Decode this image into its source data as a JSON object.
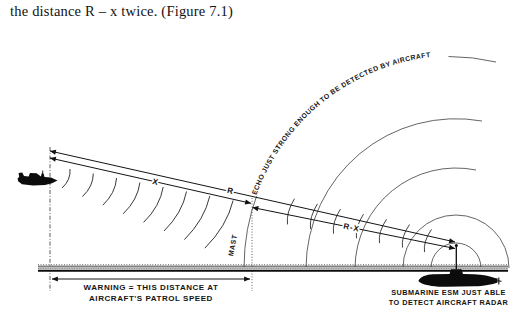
{
  "caption": "the distance R – x twice. (Figure 7.1)",
  "figure": {
    "distance_labels": {
      "x": "X",
      "r": "R",
      "r_minus_x": "R-X"
    },
    "mast_label": "MAST",
    "echo_label": "ECHO JUST STRONG ENOUGH TO BE DETECTED BY AIRCRAFT",
    "warning": {
      "line1": "WARNING = THIS DISTANCE AT",
      "line2": "AIRCRAFT'S PATROL SPEED"
    },
    "submarine_caption": {
      "line1": "SUBMARINE ESM JUST ABLE",
      "line2": "TO DETECT AIRCRAFT RADAR"
    },
    "colors": {
      "ink": "#111111",
      "sea": "#bcbcbc"
    }
  }
}
